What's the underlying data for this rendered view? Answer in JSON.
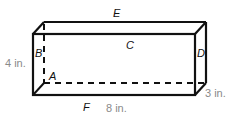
{
  "diagram": {
    "type": "rectangular-prism",
    "colors": {
      "edge": "#111111",
      "dimension_text": "#8a8a8a",
      "background": "#ffffff"
    },
    "vertex_labels": {
      "A": "A",
      "B": "B",
      "C": "C",
      "D": "D",
      "E": "E",
      "F": "F"
    },
    "dimensions": {
      "height": "4 in.",
      "length": "8 in.",
      "width": "3 in."
    }
  }
}
